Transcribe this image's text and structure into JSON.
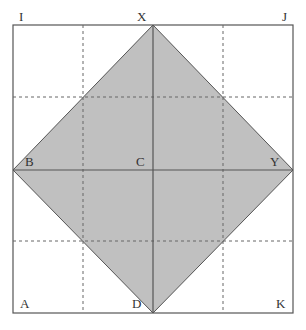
{
  "diagram": {
    "type": "geometry-square-with-inscribed-rhombus",
    "colors": {
      "fill": "#c0c0c0",
      "line": "#555555",
      "grid": "#666666",
      "label": "#333333"
    },
    "points": {
      "I": {
        "label": "I"
      },
      "X": {
        "label": "X"
      },
      "J": {
        "label": "J"
      },
      "B": {
        "label": "B"
      },
      "C": {
        "label": "C"
      },
      "Y": {
        "label": "Y"
      },
      "A": {
        "label": "A"
      },
      "D": {
        "label": "D"
      },
      "K": {
        "label": "K"
      }
    },
    "shaded_region": "XYDB",
    "segments": [
      "XD",
      "BY"
    ],
    "grid": "4x4 dashed"
  }
}
